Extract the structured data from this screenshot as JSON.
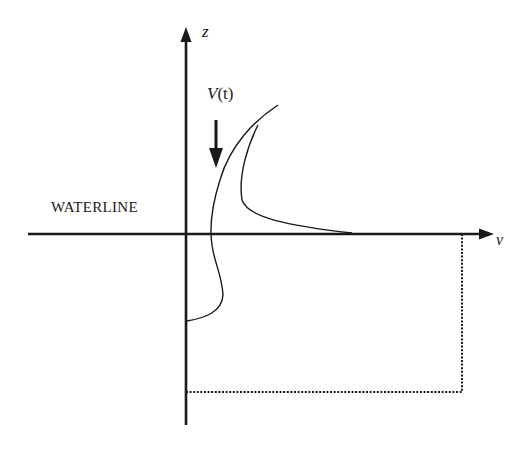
{
  "diagram": {
    "axes": {
      "vertical_label": "z",
      "horizontal_label": "v"
    },
    "labels": {
      "velocity": "V(t)",
      "velocity_prefix": "V",
      "velocity_arg": "(t)",
      "waterline": "WATERLINE"
    },
    "elements": [
      "vertical z-axis with arrow",
      "horizontal v-axis (waterline) with arrow",
      "downward arrow indicating V(t)",
      "free-surface jet profile curves",
      "dotted rectangular domain boundary below waterline"
    ],
    "colors": {
      "ink": "#1a1a1a",
      "background": "#ffffff"
    }
  }
}
